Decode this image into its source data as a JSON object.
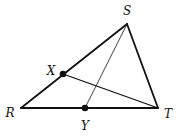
{
  "diagram": {
    "type": "triangle",
    "vertices": {
      "R": {
        "label": "R",
        "x": 21,
        "y": 108,
        "label_x": 10,
        "label_y": 113
      },
      "S": {
        "label": "S",
        "x": 127,
        "y": 24,
        "label_x": 127,
        "label_y": 11
      },
      "T": {
        "label": "T",
        "x": 158,
        "y": 108,
        "label_x": 168,
        "label_y": 114
      }
    },
    "points": {
      "X": {
        "label": "X",
        "x": 63,
        "y": 74,
        "label_x": 51,
        "label_y": 71,
        "on_segment": "RS"
      },
      "Y": {
        "label": "Y",
        "x": 85,
        "y": 108,
        "label_x": 85,
        "label_y": 126,
        "on_segment": "RT"
      }
    },
    "segments": [
      {
        "name": "RS",
        "from": "R",
        "to": "S",
        "weight": "thick"
      },
      {
        "name": "ST",
        "from": "S",
        "to": "T",
        "weight": "thick"
      },
      {
        "name": "RT",
        "from": "R",
        "to": "T",
        "weight": "thick"
      },
      {
        "name": "XT",
        "from": "X",
        "to": "T",
        "weight": "medium"
      },
      {
        "name": "SY",
        "from": "S",
        "to": "Y",
        "weight": "thin"
      }
    ],
    "colors": {
      "stroke": "#111111",
      "point": "#111111",
      "background": "#ffffff"
    }
  }
}
